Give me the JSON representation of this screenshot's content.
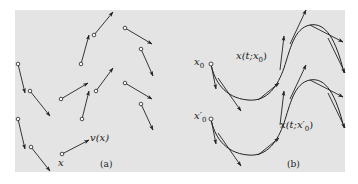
{
  "colors": {
    "panel_bg": "#e4e4e4",
    "stroke": "#222222",
    "page_bg": "#ffffff"
  },
  "panel_a": {
    "caption": "(a)",
    "point_label": "x",
    "vector_label": "v(x)"
  },
  "panel_b": {
    "caption": "(b)",
    "start_label_1": "x",
    "start_label_1_sub": "0",
    "start_label_2": "x′",
    "start_label_2_sub": "0",
    "curve_label_1": "x(t;x",
    "curve_label_1_sub": "0",
    "curve_label_1_end": ")",
    "curve_label_2": "x(t;x′",
    "curve_label_2_sub": "0",
    "curve_label_2_end": ")"
  }
}
